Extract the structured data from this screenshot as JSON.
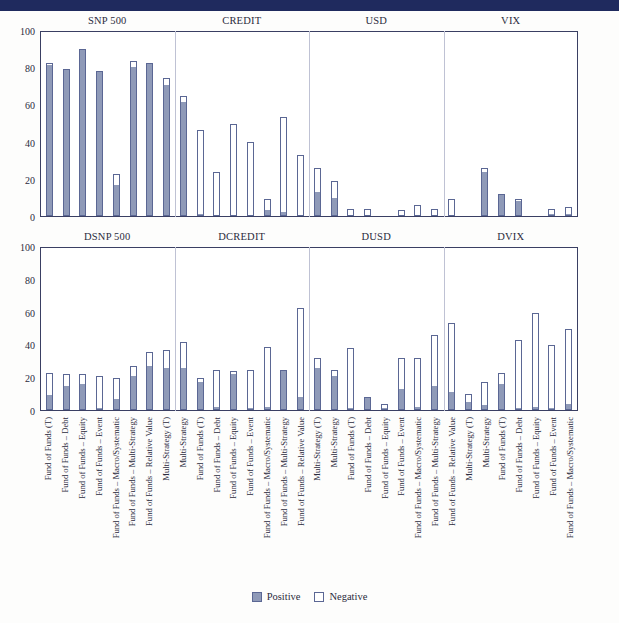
{
  "header": {
    "bar_color": "#1f2a5e"
  },
  "colors": {
    "positive": "#8f9ab8",
    "negative": "#ffffff",
    "bar_outline": "#5b6794",
    "axis": "#3a3f63",
    "separator": "#bfc2d4"
  },
  "legend": {
    "position": "bottom-center",
    "positive_label": "Positive",
    "negative_label": "Negative"
  },
  "categories": [
    "Fund of Funds (T)",
    "Fund of Funds – Debt",
    "Fund of Funds – Equity",
    "Fund of Funds – Event",
    "Fund of Funds – Macro/Systematic",
    "Fund of Funds – Multi-Strategy",
    "Fund of Funds – Relative Value",
    "Multi-Strategy (T)",
    "Multi-Strategy"
  ],
  "yaxis": {
    "ticks": [
      "0",
      "20",
      "40",
      "60",
      "80",
      "100"
    ],
    "min": 0,
    "max": 100
  },
  "chart_data": [
    {
      "type": "bar",
      "title": "",
      "panel_id": "panel1",
      "stacked": true,
      "groups": [
        "SNP 500",
        "CREDIT",
        "USD",
        "VIX"
      ],
      "xlabel": "",
      "ylabel": "",
      "ylim": [
        0,
        100
      ],
      "grid": false,
      "legend": [
        "Positive",
        "Negative"
      ],
      "categories": [
        "Fund of Funds (T)",
        "Fund of Funds – Debt",
        "Fund of Funds – Equity",
        "Fund of Funds – Event",
        "Fund of Funds – Macro/Systematic",
        "Fund of Funds – Multi-Strategy",
        "Fund of Funds – Relative Value",
        "Multi-Strategy (T)",
        "Fund of Funds (T)",
        "Fund of Funds – Debt",
        "Fund of Funds – Equity",
        "Fund of Funds – Event",
        "Fund of Funds – Macro/Systematic",
        "Fund of Funds – Multi-Strategy",
        "Fund of Funds – Relative Value",
        "Multi-Strategy",
        "Fund of Funds (T)",
        "Fund of Funds – Debt",
        "Fund of Funds – Equity",
        "Fund of Funds – Event",
        "Fund of Funds – Macro/Systematic",
        "Fund of Funds – Multi-Strategy",
        "Fund of Funds – Relative Value",
        "Multi-Strategy",
        "Fund of Funds (T)",
        "Fund of Funds – Debt",
        "Fund of Funds – Equity",
        "Fund of Funds – Event",
        "Fund of Funds – Macro/Systematic",
        "Fund of Funds – Multi-Strategy",
        "Fund of Funds – Relative Value",
        "Multi-Strategy"
      ],
      "series": [
        {
          "name": "Positive",
          "values": [
            82,
            80,
            90,
            79,
            17,
            81,
            83,
            71,
            62,
            1,
            0,
            0,
            0,
            3,
            2,
            0,
            13,
            10,
            0,
            0,
            0,
            0,
            0,
            0,
            0,
            0,
            24,
            12,
            8,
            0,
            1,
            1
          ]
        },
        {
          "name": "Negative",
          "values": [
            1,
            0,
            1,
            0,
            6,
            3,
            0,
            4,
            3,
            46,
            24,
            50,
            40,
            6,
            52,
            33,
            13,
            9,
            4,
            4,
            0,
            3,
            6,
            4,
            9,
            0,
            2,
            0,
            1,
            0,
            3,
            4
          ]
        }
      ],
      "totals": [
        83,
        80,
        91,
        79,
        23,
        84,
        83,
        75,
        65,
        47,
        24,
        50,
        40,
        9,
        54,
        33,
        26,
        19,
        4,
        4,
        0,
        3,
        6,
        4,
        9,
        0,
        26,
        12,
        9,
        0,
        4,
        5
      ]
    },
    {
      "type": "bar",
      "title": "",
      "panel_id": "panel2",
      "stacked": true,
      "groups": [
        "DSNP 500",
        "DCREDIT",
        "DUSD",
        "DVIX"
      ],
      "xlabel": "",
      "ylabel": "",
      "ylim": [
        0,
        100
      ],
      "grid": false,
      "legend": [
        "Positive",
        "Negative"
      ],
      "categories": [
        "Fund of Funds (T)",
        "Fund of Funds – Debt",
        "Fund of Funds – Equity",
        "Fund of Funds – Event",
        "Fund of Funds – Macro/Systematic",
        "Fund of Funds – Multi-Strategy",
        "Fund of Funds – Relative Value",
        "Multi-Strategy (T)",
        "Multi-Strategy",
        "Fund of Funds (T)",
        "Fund of Funds – Debt",
        "Fund of Funds – Equity",
        "Fund of Funds – Event",
        "Fund of Funds – Macro/Systematic",
        "Fund of Funds – Multi-Strategy",
        "Fund of Funds – Relative Value",
        "Multi-Strategy (T)",
        "Multi-Strategy",
        "Fund of Funds (T)",
        "Fund of Funds – Debt",
        "Fund of Funds – Equity",
        "Fund of Funds – Event",
        "Fund of Funds – Macro/Systematic",
        "Fund of Funds – Multi-Strategy",
        "Fund of Funds – Relative Value",
        "Multi-Strategy (T)",
        "Multi-Strategy",
        "Fund of Funds (T)",
        "Fund of Funds – Debt",
        "Fund of Funds – Equity",
        "Fund of Funds – Event",
        "Fund of Funds – Macro/Systematic"
      ],
      "series": [
        {
          "name": "Positive",
          "values": [
            9,
            15,
            16,
            1,
            7,
            21,
            27,
            26,
            26,
            17,
            2,
            22,
            1,
            2,
            24,
            8,
            26,
            21,
            1,
            8,
            1,
            13,
            2,
            15,
            11,
            5,
            3,
            16,
            1,
            2,
            1,
            4
          ]
        },
        {
          "name": "Negative",
          "values": [
            14,
            7,
            6,
            20,
            13,
            6,
            9,
            11,
            16,
            3,
            23,
            2,
            24,
            37,
            1,
            55,
            6,
            4,
            37,
            0,
            3,
            19,
            30,
            31,
            43,
            5,
            14,
            7,
            42,
            58,
            39,
            46
          ]
        }
      ],
      "totals": [
        23,
        22,
        22,
        21,
        20,
        27,
        33,
        37,
        42,
        20,
        25,
        24,
        25,
        39,
        25,
        63,
        32,
        25,
        38,
        8,
        4,
        32,
        32,
        46,
        54,
        10,
        17,
        23,
        43,
        60,
        40,
        50
      ]
    }
  ]
}
